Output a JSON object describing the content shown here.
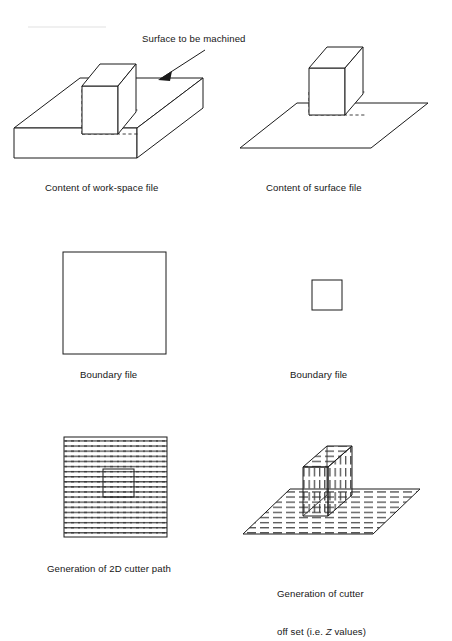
{
  "figure": {
    "title_annotation": "Surface to be machined",
    "panels": [
      {
        "id": "work-space",
        "caption": "Content of work-space file",
        "description": "isometric solid block with small box on top surface"
      },
      {
        "id": "surface",
        "caption": "Content of surface file",
        "description": "isometric flat plane with small box on it"
      },
      {
        "id": "boundary-large",
        "caption": "Boundary file",
        "description": "large empty square outline"
      },
      {
        "id": "boundary-small",
        "caption": "Boundary file",
        "description": "small empty square outline"
      },
      {
        "id": "cutter-path-2d",
        "caption": "Generation of 2D cutter path",
        "description": "square filled with horizontal dashed raster lines with inner square island"
      },
      {
        "id": "cutter-offset",
        "caption_line1": "Generation of cutter",
        "caption_line2_pre": "off set (i.e. ",
        "caption_line2_italic": "Z",
        "caption_line2_post": " values)",
        "description": "isometric hatched plane with hatched box showing Z offsets"
      }
    ],
    "colors": {
      "line": "#1b1b1b",
      "hidden_line": "#2b2b2b",
      "background": "#ffffff",
      "text": "#161616"
    }
  }
}
